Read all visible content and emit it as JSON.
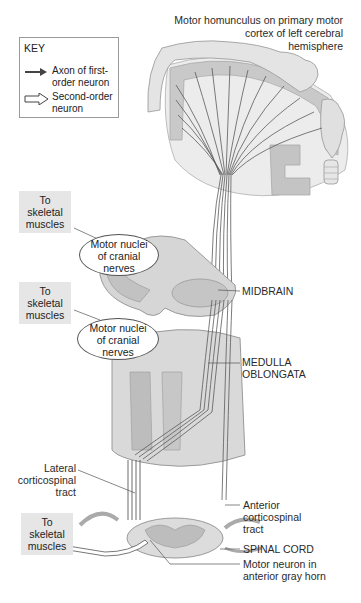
{
  "title_label": {
    "line1": "Motor homunculus on primary motor",
    "line2": "cortex of left cerebral",
    "line3": "hemisphere"
  },
  "key": {
    "title": "KEY",
    "items": [
      {
        "icon": "solid-arrow-icon",
        "line1": "Axon of first-",
        "line2": "order neuron"
      },
      {
        "icon": "hollow-arrow-icon",
        "line1": "Second-order",
        "line2": "neuron"
      }
    ]
  },
  "targets": [
    {
      "line1": "To",
      "line2": "skeletal",
      "line3": "muscles"
    },
    {
      "line1": "To",
      "line2": "skeletal",
      "line3": "muscles"
    },
    {
      "line1": "To",
      "line2": "skeletal",
      "line3": "muscles"
    }
  ],
  "nuclei": [
    {
      "line1": "Motor nuclei",
      "line2": "of cranial",
      "line3": "nerves"
    },
    {
      "line1": "Motor nuclei",
      "line2": "of cranial",
      "line3": "nerves"
    }
  ],
  "structures": {
    "midbrain": "MIDBRAIN",
    "medulla_line1": "MEDULLA",
    "medulla_line2": "OBLONGATA",
    "spinal_cord": "SPINAL CORD"
  },
  "tracts": {
    "lateral": {
      "line1": "Lateral",
      "line2": "corticospinal",
      "line3": "tract"
    },
    "anterior": {
      "line1": "Anterior",
      "line2": "corticospinal",
      "line3": "tract"
    }
  },
  "motor_neuron": {
    "line1": "Motor neuron in",
    "line2": "anterior gray horn"
  },
  "colors": {
    "tissue_light": "#e8e8e8",
    "tissue_mid": "#cfcfcf",
    "tissue_dark": "#a9a9a9",
    "axon": "#555555",
    "box_fill": "#e6e6e6"
  }
}
